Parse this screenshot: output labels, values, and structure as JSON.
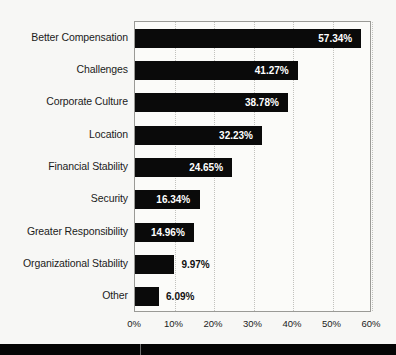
{
  "chart_data": {
    "type": "bar",
    "orientation": "horizontal",
    "title": "",
    "xlabel": "",
    "ylabel": "",
    "xlim": [
      0,
      60
    ],
    "grid": true,
    "legend": null,
    "bar_color": "#0a0a0a",
    "plot_background": "#fbfbf9",
    "figure_background": "#f7f7f5",
    "value_suffix": "%",
    "categories": [
      "Better Compensation",
      "Challenges",
      "Corporate Culture",
      "Location",
      "Financial Stability",
      "Security",
      "Greater Responsibility",
      "Organizational Stability",
      "Other"
    ],
    "values": [
      57.34,
      41.27,
      38.78,
      32.23,
      24.65,
      16.34,
      14.96,
      9.97,
      6.09
    ],
    "value_labels": [
      "57.34%",
      "41.27%",
      "38.78%",
      "32.23%",
      "24.65%",
      "16.34%",
      "14.96%",
      "9.97%",
      "6.09%"
    ],
    "xticks": [
      0,
      10,
      20,
      30,
      40,
      50,
      60
    ],
    "xtick_labels": [
      "0%",
      "10%",
      "20%",
      "30%",
      "40%",
      "50%",
      "60%"
    ]
  }
}
